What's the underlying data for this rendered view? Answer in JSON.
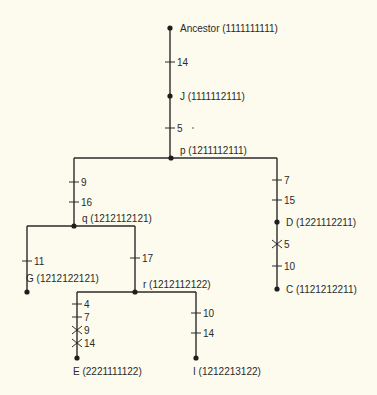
{
  "accent_colors": {
    "line": "#2a2a2a",
    "background": "#fcfbee"
  },
  "nodes": [
    {
      "id": "ancestor",
      "name": "Ancestor",
      "code": "(1111111111)",
      "type": "root"
    },
    {
      "id": "J",
      "name": "J",
      "code": "(1111112111)",
      "type": "internal-sample"
    },
    {
      "id": "p",
      "name": "p",
      "code": "(1211112111)",
      "type": "hypothetical"
    },
    {
      "id": "q",
      "name": "q",
      "code": "(1212112121)",
      "type": "hypothetical"
    },
    {
      "id": "r",
      "name": "r",
      "code": "(1212112122)",
      "type": "hypothetical"
    },
    {
      "id": "D",
      "name": "D",
      "code": "(1221112211)",
      "type": "internal-sample"
    },
    {
      "id": "G",
      "name": "G",
      "code": "(1212122121)",
      "type": "tip"
    },
    {
      "id": "C",
      "name": "C",
      "code": "(1121212211)",
      "type": "tip"
    },
    {
      "id": "E",
      "name": "E",
      "code": "(2221111122)",
      "type": "tip"
    },
    {
      "id": "I",
      "name": "I",
      "code": "(1212213122)",
      "type": "tip"
    }
  ],
  "branches": [
    {
      "from": "ancestor",
      "to": "J",
      "changes": [
        {
          "char": "14",
          "reversal": false
        }
      ]
    },
    {
      "from": "J",
      "to": "p",
      "changes": [
        {
          "char": "5",
          "reversal": false
        }
      ]
    },
    {
      "from": "p",
      "to": "q",
      "changes": [
        {
          "char": "9",
          "reversal": false
        },
        {
          "char": "16",
          "reversal": false
        }
      ]
    },
    {
      "from": "p",
      "to": "D",
      "changes": [
        {
          "char": "7",
          "reversal": false
        },
        {
          "char": "15",
          "reversal": false
        }
      ]
    },
    {
      "from": "D",
      "to": "C",
      "changes": [
        {
          "char": "5",
          "reversal": true
        },
        {
          "char": "10",
          "reversal": false
        }
      ]
    },
    {
      "from": "q",
      "to": "G",
      "changes": [
        {
          "char": "11",
          "reversal": false
        }
      ]
    },
    {
      "from": "q",
      "to": "r",
      "changes": [
        {
          "char": "17",
          "reversal": false
        }
      ]
    },
    {
      "from": "r",
      "to": "E",
      "changes": [
        {
          "char": "4",
          "reversal": false
        },
        {
          "char": "7",
          "reversal": false
        },
        {
          "char": "9",
          "reversal": true
        },
        {
          "char": "14",
          "reversal": true
        }
      ]
    },
    {
      "from": "r",
      "to": "I",
      "changes": [
        {
          "char": "10",
          "reversal": false
        },
        {
          "char": "14",
          "reversal": false
        }
      ]
    }
  ]
}
